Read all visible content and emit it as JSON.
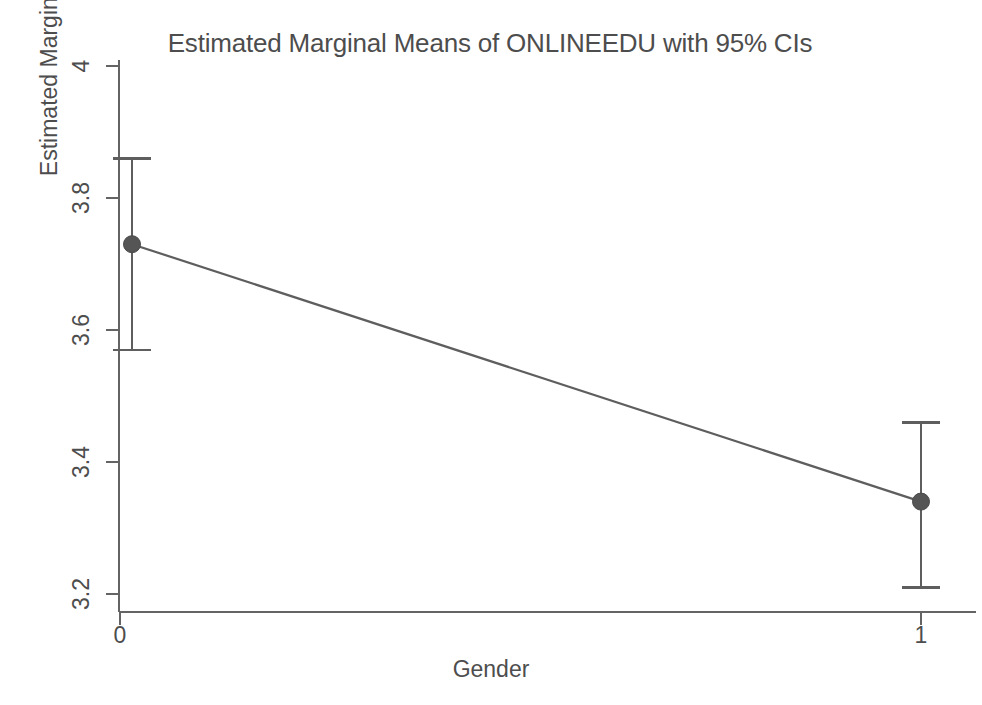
{
  "chart_data": {
    "type": "line",
    "title": "Estimated Marginal Means of ONLINEEDU with 95% CIs",
    "xlabel": "Gender",
    "ylabel": "Estimated Marginal Means",
    "categories": [
      "0",
      "1"
    ],
    "x": [
      0,
      1
    ],
    "values": [
      3.73,
      3.34
    ],
    "error_type": "95% CI",
    "ci_lower": [
      3.57,
      3.21
    ],
    "ci_upper": [
      3.86,
      3.46
    ],
    "series": [
      {
        "name": "ONLINEEDU",
        "values": [
          3.73,
          3.34
        ],
        "ci_lower": [
          3.57,
          3.21
        ],
        "ci_upper": [
          3.86,
          3.46
        ]
      }
    ],
    "ylim": [
      3.12,
      4.0
    ],
    "yticks": [
      3.2,
      3.4,
      3.6,
      3.8,
      4
    ],
    "ytick_labels": [
      "3.2",
      "3.4",
      "3.6",
      "3.8",
      "4"
    ],
    "xtick_labels": [
      "0",
      "1"
    ],
    "grid": false,
    "legend": "none",
    "marker": "circle",
    "line_color": "#595959",
    "marker_color": "#555555",
    "error_bar_color": "#595959",
    "axis_color": "#6b6b6b",
    "background_color": "#ffffff"
  },
  "axis": {
    "y_ticks": [
      {
        "label": "4",
        "value": 4
      },
      {
        "label": "3.8",
        "value": 3.8
      },
      {
        "label": "3.6",
        "value": 3.6
      },
      {
        "label": "3.4",
        "value": 3.4
      },
      {
        "label": "3.2",
        "value": 3.2
      }
    ],
    "x_ticks": [
      {
        "label": "0",
        "value": 0
      },
      {
        "label": "1",
        "value": 1
      }
    ]
  }
}
